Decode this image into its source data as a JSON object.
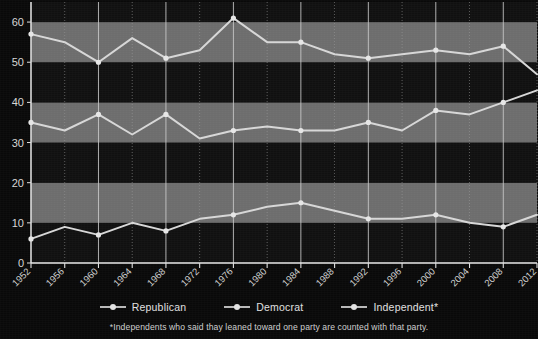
{
  "chart_data": {
    "type": "line",
    "title": "",
    "subtitle": "",
    "xlabel": "",
    "ylabel": "",
    "x": [
      1952,
      1956,
      1960,
      1964,
      1968,
      1972,
      1976,
      1980,
      1984,
      1988,
      1992,
      1996,
      2000,
      2004,
      2008,
      2012
    ],
    "categories": [
      "1952",
      "1956",
      "1960",
      "1964",
      "1968",
      "1972",
      "1976",
      "1980",
      "1984",
      "1988",
      "1992",
      "1996",
      "2000",
      "2004",
      "2008",
      "2012"
    ],
    "series": [
      {
        "name": "Democrat",
        "values": [
          57,
          55,
          50,
          56,
          51,
          53,
          61,
          55,
          55,
          52,
          51,
          52,
          53,
          52,
          54,
          47
        ]
      },
      {
        "name": "Republican",
        "values": [
          35,
          33,
          37,
          32,
          37,
          31,
          33,
          34,
          33,
          33,
          35,
          33,
          38,
          37,
          40,
          43
        ]
      },
      {
        "name": "Independent*",
        "values": [
          6,
          9,
          7,
          10,
          8,
          11,
          12,
          14,
          15,
          13,
          11,
          11,
          12,
          10,
          9,
          12
        ]
      }
    ],
    "ylim": [
      0,
      65
    ],
    "yticks": [
      0,
      10,
      20,
      30,
      40,
      50,
      60
    ],
    "ytick_labels": [
      "0",
      "10",
      "20",
      "30",
      "40",
      "50",
      "60"
    ],
    "grid": true,
    "legend_position": "bottom",
    "banded_background": true,
    "accent_color": "#d9d9d9",
    "background_color": "#0a0a0a"
  },
  "legend": {
    "items": [
      {
        "label": "Republican",
        "marker": "line-dot-marker"
      },
      {
        "label": "Democrat",
        "marker": "line-dot-marker"
      },
      {
        "label": "Independent*",
        "marker": "line-dot-marker"
      }
    ]
  },
  "footnote": {
    "text": "*Independents who said thay leaned toward one party are counted with that party."
  }
}
